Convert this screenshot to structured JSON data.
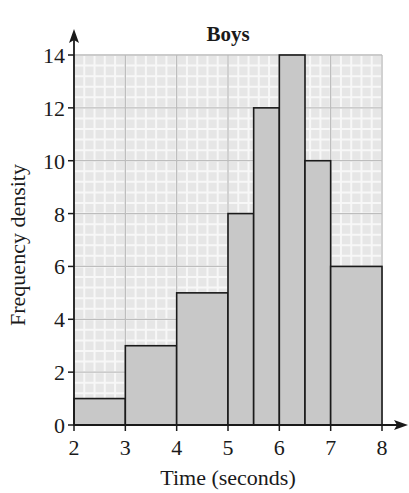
{
  "chart_data": {
    "type": "bar",
    "subtype": "histogram",
    "title": "Boys",
    "xlabel": "Time (seconds)",
    "ylabel": "Frequency density",
    "xlim": [
      2,
      8
    ],
    "ylim": [
      0,
      14
    ],
    "x_ticks": [
      2,
      3,
      4,
      5,
      6,
      7,
      8
    ],
    "y_ticks": [
      0,
      2,
      4,
      6,
      8,
      10,
      12,
      14
    ],
    "grid": true,
    "legend": null,
    "bins": [
      {
        "start": 2,
        "end": 3,
        "value": 1
      },
      {
        "start": 3,
        "end": 4,
        "value": 3
      },
      {
        "start": 4,
        "end": 5,
        "value": 5
      },
      {
        "start": 5,
        "end": 5.5,
        "value": 8
      },
      {
        "start": 5.5,
        "end": 6,
        "value": 12
      },
      {
        "start": 6,
        "end": 6.5,
        "value": 14
      },
      {
        "start": 6.5,
        "end": 7,
        "value": 10
      },
      {
        "start": 7,
        "end": 8,
        "value": 6
      }
    ],
    "categories": [
      "2-3",
      "3-4",
      "4-5",
      "5-5.5",
      "5.5-6",
      "6-6.5",
      "6.5-7",
      "7-8"
    ],
    "values": [
      1,
      3,
      5,
      8,
      12,
      14,
      10,
      6
    ]
  },
  "colors": {
    "bar_fill": "#c8c8c8",
    "bar_stroke": "#1a1a1a",
    "grid_bg": "#e6e6e6",
    "grid_minor": "#f7f7f7",
    "grid_major": "#bdbdbd",
    "axis": "#1a1a1a"
  }
}
